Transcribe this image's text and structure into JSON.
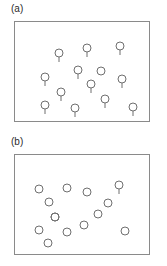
{
  "figure": {
    "panels": [
      {
        "id": "a",
        "label": "(a)",
        "marker_shape": "circle-with-tail",
        "frame_color": "#8a8a8a",
        "marker_color": "#6f6f6f",
        "background": "#ffffff",
        "marker_radius": 4,
        "tail_length": 5,
        "marker_count": 13,
        "markers": [
          {
            "x": 30,
            "y": 55,
            "tail": true
          },
          {
            "x": 30,
            "y": 83,
            "tail": true
          },
          {
            "x": 44,
            "y": 31,
            "tail": true
          },
          {
            "x": 46,
            "y": 70,
            "tail": true
          },
          {
            "x": 60,
            "y": 86,
            "tail": true
          },
          {
            "x": 63,
            "y": 48,
            "tail": true
          },
          {
            "x": 72,
            "y": 26,
            "tail": true
          },
          {
            "x": 76,
            "y": 62,
            "tail": true
          },
          {
            "x": 86,
            "y": 49,
            "tail": false
          },
          {
            "x": 90,
            "y": 77,
            "tail": true
          },
          {
            "x": 105,
            "y": 24,
            "tail": true
          },
          {
            "x": 107,
            "y": 57,
            "tail": true
          },
          {
            "x": 118,
            "y": 85,
            "tail": true
          }
        ]
      },
      {
        "id": "b",
        "label": "(b)",
        "marker_shape": "circle",
        "frame_color": "#8a8a8a",
        "marker_color": "#6f6f6f",
        "background": "#ffffff",
        "marker_radius": 4,
        "tail_length": 5,
        "marker_count": 14,
        "markers": [
          {
            "x": 24,
            "y": 34,
            "tail": false
          },
          {
            "x": 34,
            "y": 47,
            "tail": false
          },
          {
            "x": 24,
            "y": 75,
            "tail": false
          },
          {
            "x": 33,
            "y": 88,
            "tail": false
          },
          {
            "x": 40,
            "y": 62,
            "tail": false
          },
          {
            "x": 52,
            "y": 33,
            "tail": false
          },
          {
            "x": 52,
            "y": 77,
            "tail": false
          },
          {
            "x": 69,
            "y": 70,
            "tail": false
          },
          {
            "x": 72,
            "y": 37,
            "tail": false
          },
          {
            "x": 83,
            "y": 59,
            "tail": false
          },
          {
            "x": 93,
            "y": 48,
            "tail": false
          },
          {
            "x": 104,
            "y": 30,
            "tail": true
          },
          {
            "x": 110,
            "y": 76,
            "tail": false
          },
          {
            "x": 40,
            "y": 62,
            "tail": false
          }
        ]
      }
    ]
  }
}
